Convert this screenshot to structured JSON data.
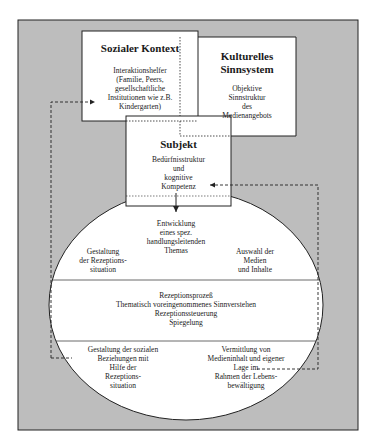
{
  "colors": {
    "frame_fill": "#bdbdbd",
    "box_fill": "#ffffff",
    "stroke": "#222222"
  },
  "diagram": {
    "social_context": {
      "title": "Sozialer Kontext",
      "body": [
        "Interaktionshelfer",
        "(Familie, Peers,",
        "gesellschaftliche",
        "Institutionen wie z.B.",
        "Kindergarten)"
      ]
    },
    "cultural_system": {
      "title": [
        "Kulturelles",
        "Sinnsystem"
      ],
      "body": [
        "Objektive",
        "Sinnstruktur",
        "des",
        "Medienangebots"
      ]
    },
    "subject": {
      "title": "Subjekt",
      "body": [
        "Bedürfnisstruktur",
        "und",
        "kognitive",
        "Kompetenz"
      ]
    },
    "circle": {
      "top_center": [
        "Entwicklung",
        "eines spez.",
        "handlungsleitenden",
        "Themas"
      ],
      "top_left": [
        "Gestaltung",
        "der Rezeptions-",
        "situation"
      ],
      "top_right": [
        "Auswahl der",
        "Medien",
        "und Inhalte"
      ],
      "middle": [
        "Rezeptionsprozeß",
        "Thematisch voreingenommenes Sinnverstehen",
        "Rezeptionssteuerung",
        "Spiegelung"
      ],
      "bottom_left": [
        "Gestaltung der sozialen",
        "Beziehungen mit",
        "Hilfe der",
        "Rezeptions-",
        "situation"
      ],
      "bottom_right": [
        "Vermittlung von",
        "Medieninhalt und eigener",
        "Lage im",
        "Rahmen der Lebens-",
        "bewältigung"
      ]
    }
  }
}
